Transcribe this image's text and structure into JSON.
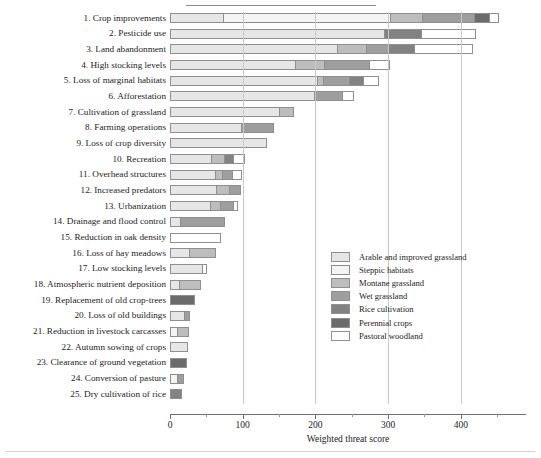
{
  "chart_data": {
    "type": "bar",
    "orientation": "horizontal",
    "stacked": true,
    "title": "",
    "xlabel": "Weighted threat score",
    "ylabel": "",
    "xlim": [
      0,
      480
    ],
    "xticks": [
      0,
      100,
      200,
      300,
      400
    ],
    "xtick_labels": [
      "0",
      "100",
      "200",
      "300",
      "400"
    ],
    "grid": true,
    "legend_position": "center-right",
    "series": [
      {
        "name": "Arable and improved grassland",
        "color": "#e6e6e6"
      },
      {
        "name": "Steppic habitats",
        "color": "#f4f4f4"
      },
      {
        "name": "Montane grassland",
        "color": "#bdbdbd"
      },
      {
        "name": "Wet grassland",
        "color": "#9e9e9e"
      },
      {
        "name": "Rice cultivation",
        "color": "#828282"
      },
      {
        "name": "Perennial crops",
        "color": "#6b6b6b"
      },
      {
        "name": "Pastoral woodland",
        "color": "#ffffff"
      }
    ],
    "categories": [
      "1. Crop improvements",
      "2. Pesticide use",
      "3. Land abandonment",
      "4. High stocking levels",
      "5. Loss of marginal habitats",
      "6. Afforestation",
      "7. Cultivation of grassland",
      "8. Farming operations",
      "9. Loss of crop diversity",
      "10. Recreation",
      "11. Overhead structures",
      "12. Increased predators",
      "13. Urbanization",
      "14. Drainage and flood control",
      "15. Reduction in oak density",
      "16. Loss of hay meadows",
      "17. Low stocking levels",
      "18. Atmospheric nutrient deposition",
      "19. Replacement of old crop-trees",
      "20. Loss of old buildings",
      "21. Reduction in livestock carcasses",
      "22. Autumn sowing of crops",
      "23. Clearance of ground vegetation",
      "24. Conversion of pasture",
      "25. Dry cultivation of rice"
    ],
    "values": [
      {
        "category": "1. Crop improvements",
        "total": 452,
        "segments": [
          {
            "series": "Arable and improved grassland",
            "value": 73
          },
          {
            "series": "Steppic habitats",
            "value": 230
          },
          {
            "series": "Montane grassland",
            "value": 43
          },
          {
            "series": "Wet grassland",
            "value": 72
          },
          {
            "series": "Perennial crops",
            "value": 21
          },
          {
            "series": "Pastoral woodland",
            "value": 13
          }
        ]
      },
      {
        "category": "2. Pesticide use",
        "total": 421,
        "segments": [
          {
            "series": "Arable and improved grassland",
            "value": 295
          },
          {
            "series": "Rice cultivation",
            "value": 50
          },
          {
            "series": "Pastoral woodland",
            "value": 76
          }
        ]
      },
      {
        "category": "3. Land abandonment",
        "total": 417,
        "segments": [
          {
            "series": "Arable and improved grassland",
            "value": 230
          },
          {
            "series": "Montane grassland",
            "value": 40
          },
          {
            "series": "Wet grassland",
            "value": 30
          },
          {
            "series": "Rice cultivation",
            "value": 35
          },
          {
            "series": "Pastoral woodland",
            "value": 82
          }
        ]
      },
      {
        "category": "4. High stocking levels",
        "total": 302,
        "segments": [
          {
            "series": "Arable and improved grassland",
            "value": 172
          },
          {
            "series": "Montane grassland",
            "value": 40
          },
          {
            "series": "Wet grassland",
            "value": 62
          },
          {
            "series": "Pastoral woodland",
            "value": 28
          }
        ]
      },
      {
        "category": "5. Loss of marginal habitats",
        "total": 287,
        "segments": [
          {
            "series": "Arable and improved grassland",
            "value": 202
          },
          {
            "series": "Montane grassland",
            "value": 8
          },
          {
            "series": "Wet grassland",
            "value": 36
          },
          {
            "series": "Rice cultivation",
            "value": 20
          },
          {
            "series": "Pastoral woodland",
            "value": 21
          }
        ]
      },
      {
        "category": "6. Afforestation",
        "total": 253,
        "segments": [
          {
            "series": "Arable and improved grassland",
            "value": 198
          },
          {
            "series": "Wet grassland",
            "value": 38
          },
          {
            "series": "Pastoral woodland",
            "value": 17
          }
        ]
      },
      {
        "category": "7. Cultivation of grassland",
        "total": 171,
        "segments": [
          {
            "series": "Arable and improved grassland",
            "value": 150
          },
          {
            "series": "Montane grassland",
            "value": 21
          }
        ]
      },
      {
        "category": "8. Farming operations",
        "total": 143,
        "segments": [
          {
            "series": "Arable and improved grassland",
            "value": 97
          },
          {
            "series": "Wet grassland",
            "value": 46
          }
        ]
      },
      {
        "category": "9. Loss of crop diversity",
        "total": 134,
        "segments": [
          {
            "series": "Arable and improved grassland",
            "value": 134
          }
        ]
      },
      {
        "category": "10. Recreation",
        "total": 103,
        "segments": [
          {
            "series": "Arable and improved grassland",
            "value": 56
          },
          {
            "series": "Montane grassland",
            "value": 18
          },
          {
            "series": "Rice cultivation",
            "value": 13
          },
          {
            "series": "Pastoral woodland",
            "value": 16
          }
        ]
      },
      {
        "category": "11. Overhead structures",
        "total": 99,
        "segments": [
          {
            "series": "Arable and improved grassland",
            "value": 62
          },
          {
            "series": "Montane grassland",
            "value": 9
          },
          {
            "series": "Wet grassland",
            "value": 14
          },
          {
            "series": "Pastoral woodland",
            "value": 14
          }
        ]
      },
      {
        "category": "12. Increased predators",
        "total": 98,
        "segments": [
          {
            "series": "Arable and improved grassland",
            "value": 63
          },
          {
            "series": "Montane grassland",
            "value": 18
          },
          {
            "series": "Wet grassland",
            "value": 17
          }
        ]
      },
      {
        "category": "13. Urbanization",
        "total": 93,
        "segments": [
          {
            "series": "Arable and improved grassland",
            "value": 55
          },
          {
            "series": "Montane grassland",
            "value": 14
          },
          {
            "series": "Wet grassland",
            "value": 17
          },
          {
            "series": "Pastoral woodland",
            "value": 7
          }
        ]
      },
      {
        "category": "14. Drainage and flood control",
        "total": 75,
        "segments": [
          {
            "series": "Arable and improved grassland",
            "value": 14
          },
          {
            "series": "Wet grassland",
            "value": 61
          }
        ]
      },
      {
        "category": "15. Reduction in oak density",
        "total": 70,
        "segments": [
          {
            "series": "Pastoral woodland",
            "value": 70
          }
        ]
      },
      {
        "category": "16. Loss of hay meadows",
        "total": 63,
        "segments": [
          {
            "series": "Arable and improved grassland",
            "value": 26
          },
          {
            "series": "Montane grassland",
            "value": 37
          }
        ]
      },
      {
        "category": "17. Low stocking levels",
        "total": 51,
        "segments": [
          {
            "series": "Arable and improved grassland",
            "value": 44
          },
          {
            "series": "Pastoral woodland",
            "value": 7
          }
        ]
      },
      {
        "category": "18. Atmospheric nutrient deposition",
        "total": 43,
        "segments": [
          {
            "series": "Arable and improved grassland",
            "value": 13
          },
          {
            "series": "Montane grassland",
            "value": 30
          }
        ]
      },
      {
        "category": "19. Replacement of old crop-trees",
        "total": 34,
        "segments": [
          {
            "series": "Perennial crops",
            "value": 34
          }
        ]
      },
      {
        "category": "20. Loss of old buildings",
        "total": 27,
        "segments": [
          {
            "series": "Arable and improved grassland",
            "value": 19
          },
          {
            "series": "Wet grassland",
            "value": 8
          }
        ]
      },
      {
        "category": "21. Reduction in livestock carcasses",
        "total": 26,
        "segments": [
          {
            "series": "Steppic habitats",
            "value": 10
          },
          {
            "series": "Montane grassland",
            "value": 16
          }
        ]
      },
      {
        "category": "22. Autumn sowing of crops",
        "total": 25,
        "segments": [
          {
            "series": "Arable and improved grassland",
            "value": 25
          }
        ]
      },
      {
        "category": "23. Clearance of ground vegetation",
        "total": 23,
        "segments": [
          {
            "series": "Perennial crops",
            "value": 23
          }
        ]
      },
      {
        "category": "24. Conversion of pasture",
        "total": 19,
        "segments": [
          {
            "series": "Steppic habitats",
            "value": 9
          },
          {
            "series": "Wet grassland",
            "value": 10
          }
        ]
      },
      {
        "category": "25. Dry cultivation of rice",
        "total": 17,
        "segments": [
          {
            "series": "Rice cultivation",
            "value": 17
          }
        ]
      }
    ]
  }
}
